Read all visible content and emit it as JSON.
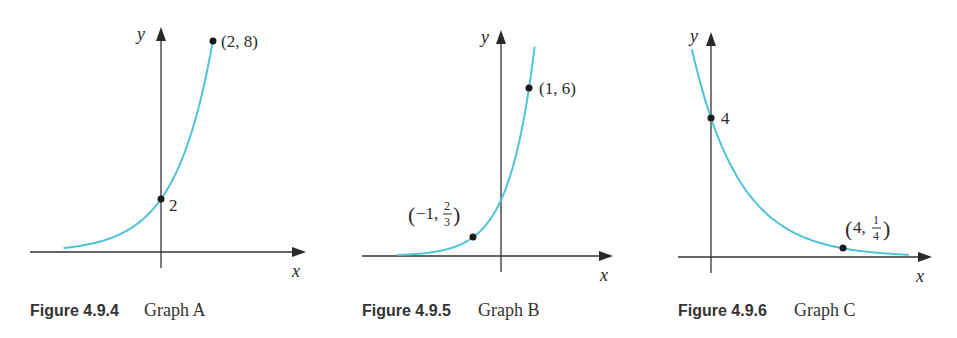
{
  "colors": {
    "curve": "#4fc3d9",
    "axis": "#333333",
    "point": "#1a1a1a"
  },
  "figures": [
    {
      "caption_number": "Figure 4.9.4",
      "caption_title": "Graph A",
      "x_label": "x",
      "y_label": "y",
      "points": [
        {
          "label": "2",
          "x": 0,
          "y": 2
        },
        {
          "label": "(2, 8)",
          "x": 2,
          "y": 8
        }
      ]
    },
    {
      "caption_number": "Figure 4.9.5",
      "caption_title": "Graph B",
      "x_label": "x",
      "y_label": "y",
      "points": [
        {
          "label_pre": "(−1, ",
          "label_num": "2",
          "label_den": "3",
          "label_post": ")",
          "x": -1,
          "y": 0.6667
        },
        {
          "label": "(1, 6)",
          "x": 1,
          "y": 6
        }
      ]
    },
    {
      "caption_number": "Figure 4.9.6",
      "caption_title": "Graph C",
      "x_label": "x",
      "y_label": "y",
      "points": [
        {
          "label": "4",
          "x": 0,
          "y": 4
        },
        {
          "label_pre": "(4, ",
          "label_num": "1",
          "label_den": "4",
          "label_post": ")",
          "x": 4,
          "y": 0.25
        }
      ]
    }
  ],
  "chart_data": [
    {
      "type": "line",
      "title": "Figure 4.9.4 Graph A",
      "xlabel": "x",
      "ylabel": "y",
      "function": "y = 2·2^x",
      "series": [
        {
          "name": "Graph A",
          "x": [
            -3.75,
            -3,
            -2,
            -1,
            0,
            1,
            2
          ],
          "values": [
            0.149,
            0.25,
            0.5,
            1,
            2,
            4,
            8
          ]
        }
      ],
      "annotations": [
        {
          "x": 0,
          "y": 2,
          "text": "2"
        },
        {
          "x": 2,
          "y": 8,
          "text": "(2, 8)"
        }
      ],
      "grid": false
    },
    {
      "type": "line",
      "title": "Figure 4.9.5 Graph B",
      "xlabel": "x",
      "ylabel": "y",
      "function": "y = 2·3^x",
      "series": [
        {
          "name": "Graph B",
          "x": [
            -3.7,
            -3,
            -2,
            -1,
            0,
            1,
            1.2
          ],
          "values": [
            0.034,
            0.074,
            0.222,
            0.667,
            2,
            6,
            7.46
          ]
        }
      ],
      "annotations": [
        {
          "x": -1,
          "y": 0.6667,
          "text": "(−1, 2/3)"
        },
        {
          "x": 1,
          "y": 6,
          "text": "(1, 6)"
        }
      ],
      "grid": false
    },
    {
      "type": "line",
      "title": "Figure 4.9.6 Graph C",
      "xlabel": "x",
      "ylabel": "y",
      "function": "y = 4·(1/2)^x",
      "series": [
        {
          "name": "Graph C",
          "x": [
            -0.58,
            0,
            1,
            2,
            3,
            4,
            5,
            6
          ],
          "values": [
            5.99,
            4,
            2,
            1,
            0.5,
            0.25,
            0.125,
            0.0625
          ]
        }
      ],
      "annotations": [
        {
          "x": 0,
          "y": 4,
          "text": "4"
        },
        {
          "x": 4,
          "y": 0.25,
          "text": "(4, 1/4)"
        }
      ],
      "grid": false
    }
  ]
}
